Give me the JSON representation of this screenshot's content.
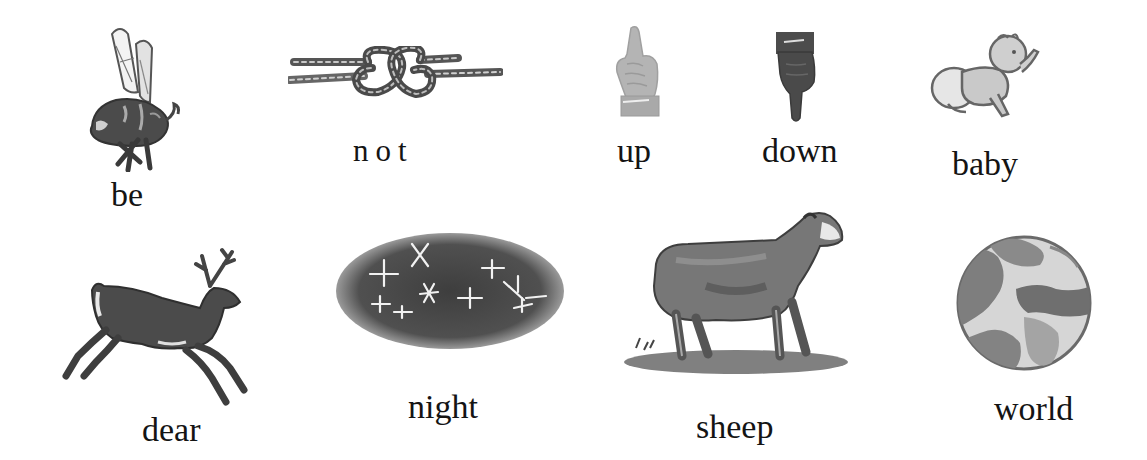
{
  "row1": [
    {
      "word": "be",
      "picture": "bee-illustration"
    },
    {
      "word": "not",
      "picture": "knot-illustration"
    },
    {
      "word": "up",
      "picture": "hand-pointing-up-illustration"
    },
    {
      "word": "down",
      "picture": "hand-pointing-down-illustration"
    },
    {
      "word": "baby",
      "picture": "crawling-baby-illustration"
    }
  ],
  "row2": [
    {
      "word": "dear",
      "picture": "leaping-deer-illustration"
    },
    {
      "word": "night",
      "picture": "starry-night-sky-illustration"
    },
    {
      "word": "sheep",
      "picture": "sheep-illustration"
    },
    {
      "word": "world",
      "picture": "globe-illustration"
    }
  ],
  "colors": {
    "ink": "#141414",
    "illustration_dark": "#3a3a3a",
    "illustration_mid": "#6e6e6e",
    "illustration_light": "#b5b5b5",
    "background": "#ffffff"
  }
}
